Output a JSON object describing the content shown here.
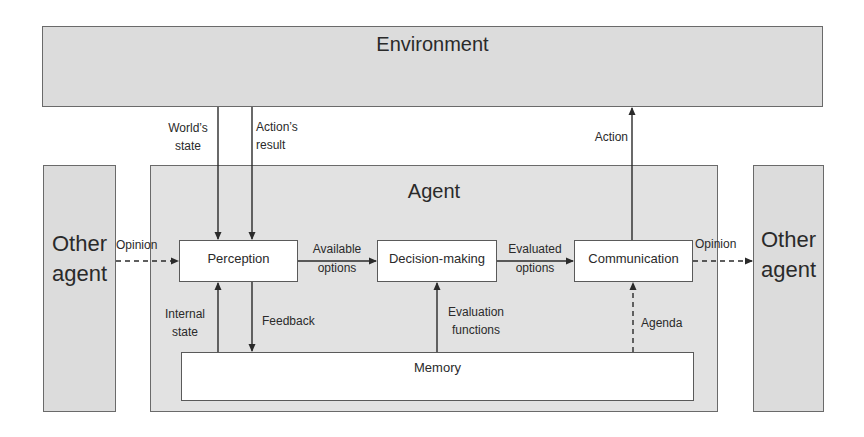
{
  "diagram": {
    "environment": {
      "label": "Environment"
    },
    "agent": {
      "label": "Agent"
    },
    "other_agent_left": {
      "label_line1": "Other",
      "label_line2": "agent"
    },
    "other_agent_right": {
      "label_line1": "Other",
      "label_line2": "agent"
    },
    "modules": {
      "perception": "Perception",
      "decision_making": "Decision-making",
      "communication": "Communication",
      "memory": "Memory"
    },
    "edges": {
      "worlds_state": {
        "line1": "World’s",
        "line2": "state"
      },
      "actions_result": {
        "line1": "Action’s",
        "line2": "result"
      },
      "action": {
        "line1": "Action"
      },
      "opinion_in": {
        "line1": "Opinion"
      },
      "opinion_out": {
        "line1": "Opinion"
      },
      "available_options": {
        "line1": "Available",
        "line2": "options"
      },
      "evaluated_options": {
        "line1": "Evaluated",
        "line2": "options"
      },
      "internal_state": {
        "line1": "Internal",
        "line2": "state"
      },
      "feedback": {
        "line1": "Feedback"
      },
      "evaluation_functions": {
        "line1": "Evaluation",
        "line2": "functions"
      },
      "agenda": {
        "line1": "Agenda"
      }
    }
  },
  "colors": {
    "container_fill": "#dcdcdc",
    "module_fill": "#ffffff",
    "stroke": "#3a3a3a"
  }
}
